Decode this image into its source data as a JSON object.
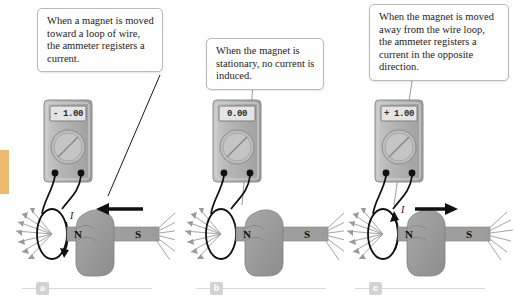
{
  "figure": {
    "background_color": "#ffffff",
    "spine_color": "#e8a33d"
  },
  "panels": [
    {
      "id": "a",
      "letter": "a",
      "callout": "When a magnet is moved toward a loop of wire, the ammeter registers a current.",
      "meter": {
        "reading": "- 1.00",
        "sign": "-",
        "value": "1.00",
        "body_color": "#b8b8b8",
        "screen_color": "#e2e2e2"
      },
      "magnet": {
        "north_label": "N",
        "south_label": "S",
        "north_color": "#9a9a9a",
        "south_color": "#9a9a9a"
      },
      "motion": {
        "arrow_direction": "left",
        "label": "",
        "present": true
      },
      "current": {
        "label": "I",
        "direction": "downward",
        "present": true
      }
    },
    {
      "id": "b",
      "letter": "b",
      "callout": "When the magnet is stationary, no current is induced.",
      "meter": {
        "reading": "0.00",
        "sign": "",
        "value": "0.00",
        "body_color": "#b8b8b8",
        "screen_color": "#e2e2e2"
      },
      "magnet": {
        "north_label": "N",
        "south_label": "S",
        "north_color": "#9a9a9a",
        "south_color": "#9a9a9a"
      },
      "motion": {
        "arrow_direction": "none",
        "label": "",
        "present": false
      },
      "current": {
        "label": "",
        "direction": "none",
        "present": false
      }
    },
    {
      "id": "c",
      "letter": "c",
      "callout": "When the magnet is moved away from the wire loop, the ammeter registers a current in the opposite direction.",
      "meter": {
        "reading": "+ 1.00",
        "sign": "+",
        "value": "1.00",
        "body_color": "#b8b8b8",
        "screen_color": "#e2e2e2"
      },
      "magnet": {
        "north_label": "N",
        "south_label": "S",
        "north_color": "#9a9a9a",
        "south_color": "#9a9a9a"
      },
      "motion": {
        "arrow_direction": "right",
        "label": "",
        "present": true
      },
      "current": {
        "label": "I",
        "direction": "upward",
        "present": true
      }
    }
  ]
}
